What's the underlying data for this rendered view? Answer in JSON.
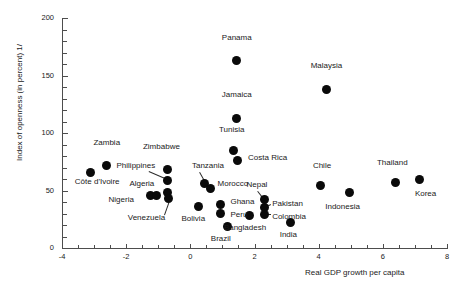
{
  "chart_data": {
    "type": "scatter",
    "title": "",
    "xlabel": "Real GDP growth per capita",
    "ylabel": "Index of openness (in percent) 1/",
    "xlim": [
      -4,
      8
    ],
    "ylim": [
      0,
      200
    ],
    "xticks": [
      -4,
      -2,
      0,
      2,
      4,
      6,
      8
    ],
    "xtick_labels": [
      "-4",
      "-2",
      "0",
      "2",
      "4",
      "6",
      "8"
    ],
    "yticks": [
      0,
      50,
      100,
      150,
      200
    ],
    "ytick_labels": [
      "0",
      "50",
      "100",
      "150",
      "200"
    ],
    "grid": false,
    "legend": "none",
    "marker": "filled-circle",
    "marker_color": "#0a0a0a",
    "points": [
      {
        "name": "Panama",
        "x": 1.45,
        "y": 163,
        "lx": 1.45,
        "ly": 183,
        "anchor": "center"
      },
      {
        "name": "Malaysia",
        "x": 4.25,
        "y": 138,
        "lx": 4.25,
        "ly": 158,
        "anchor": "center"
      },
      {
        "name": "Jamaica",
        "x": 1.45,
        "y": 113,
        "lx": 1.45,
        "ly": 133,
        "anchor": "center"
      },
      {
        "name": "Tunisia",
        "x": 1.35,
        "y": 85,
        "lx": 1.3,
        "ly": 103,
        "anchor": "center"
      },
      {
        "name": "Costa Rica",
        "x": 1.48,
        "y": 76,
        "lx": 1.8,
        "ly": 78,
        "anchor": "left"
      },
      {
        "name": "Zambia",
        "x": -2.6,
        "y": 72,
        "lx": -2.6,
        "ly": 91,
        "anchor": "center"
      },
      {
        "name": "Zimbabwe",
        "x": -0.7,
        "y": 68,
        "lx": -0.9,
        "ly": 88,
        "anchor": "center"
      },
      {
        "name": "Côte d'Ivoire",
        "x": -3.1,
        "y": 66,
        "lx": -3.6,
        "ly": 57,
        "anchor": "left"
      },
      {
        "name": "Philippines",
        "x": -0.7,
        "y": 59,
        "lx": -2.3,
        "ly": 71,
        "anchor": "left"
      },
      {
        "name": "Tanzania",
        "x": 0.45,
        "y": 56,
        "lx": 0.05,
        "ly": 71,
        "anchor": "left"
      },
      {
        "name": "Morocco",
        "x": 0.62,
        "y": 52,
        "lx": 0.85,
        "ly": 56,
        "anchor": "left"
      },
      {
        "name": "Thailand",
        "x": 6.4,
        "y": 57,
        "lx": 6.3,
        "ly": 74,
        "anchor": "center"
      },
      {
        "name": "Korea",
        "x": 7.15,
        "y": 60,
        "lx": 7.0,
        "ly": 47,
        "anchor": "left"
      },
      {
        "name": "Chile",
        "x": 4.05,
        "y": 54,
        "lx": 4.1,
        "ly": 71,
        "anchor": "center"
      },
      {
        "name": "Indonesia",
        "x": 4.95,
        "y": 48,
        "lx": 4.75,
        "ly": 36,
        "anchor": "center"
      },
      {
        "name": "Algeria",
        "x": -0.72,
        "y": 48,
        "lx": -1.9,
        "ly": 56,
        "anchor": "left"
      },
      {
        "name": "Nigeria",
        "x": -1.25,
        "y": 46,
        "lx": -2.55,
        "ly": 42,
        "anchor": "left"
      },
      {
        "name": "Nigeria2",
        "x": -1.05,
        "y": 46,
        "lx": null,
        "ly": null,
        "anchor": "none"
      },
      {
        "name": "Nepal",
        "x": 2.32,
        "y": 42,
        "lx": 1.75,
        "ly": 55,
        "anchor": "left"
      },
      {
        "name": "Pakistan",
        "x": 2.32,
        "y": 35,
        "lx": 2.55,
        "ly": 38,
        "anchor": "left"
      },
      {
        "name": "Colombia",
        "x": 2.32,
        "y": 29,
        "lx": 2.55,
        "ly": 27,
        "anchor": "left"
      },
      {
        "name": "Ghana",
        "x": 0.95,
        "y": 38,
        "lx": 1.25,
        "ly": 40,
        "anchor": "left"
      },
      {
        "name": "Peru",
        "x": 0.95,
        "y": 30,
        "lx": 1.25,
        "ly": 29,
        "anchor": "left"
      },
      {
        "name": "Bolivia",
        "x": 0.25,
        "y": 36,
        "lx": 0.1,
        "ly": 25,
        "anchor": "center"
      },
      {
        "name": "Venezuela",
        "x": -0.68,
        "y": 43,
        "lx": -1.95,
        "ly": 26,
        "anchor": "left"
      },
      {
        "name": "Bangladesh",
        "x": 1.85,
        "y": 28,
        "lx": 1.7,
        "ly": 17,
        "anchor": "center"
      },
      {
        "name": "India",
        "x": 3.12,
        "y": 22,
        "lx": 3.05,
        "ly": 11,
        "anchor": "center"
      },
      {
        "name": "Brazil",
        "x": 1.15,
        "y": 19,
        "lx": 0.95,
        "ly": 8,
        "anchor": "center"
      }
    ],
    "annotations": [
      {
        "name": "Philippines",
        "from_x": -1.28,
        "from_y": 67,
        "to_x": -0.78,
        "to_y": 61
      },
      {
        "name": "Tanzania",
        "from_x": 0.3,
        "from_y": 66,
        "to_x": 0.46,
        "to_y": 58
      },
      {
        "name": "Venezuela",
        "from_x": -0.82,
        "from_y": 29,
        "to_x": -0.68,
        "to_y": 40
      },
      {
        "name": "Nepal",
        "from_x": 2.1,
        "from_y": 50,
        "to_x": 2.27,
        "to_y": 44
      },
      {
        "name": "Pakistan",
        "from_x": 2.52,
        "from_y": 37,
        "to_x": 2.38,
        "to_y": 35
      },
      {
        "name": "Colombia",
        "from_x": 2.52,
        "from_y": 29,
        "to_x": 2.38,
        "to_y": 29
      }
    ]
  }
}
